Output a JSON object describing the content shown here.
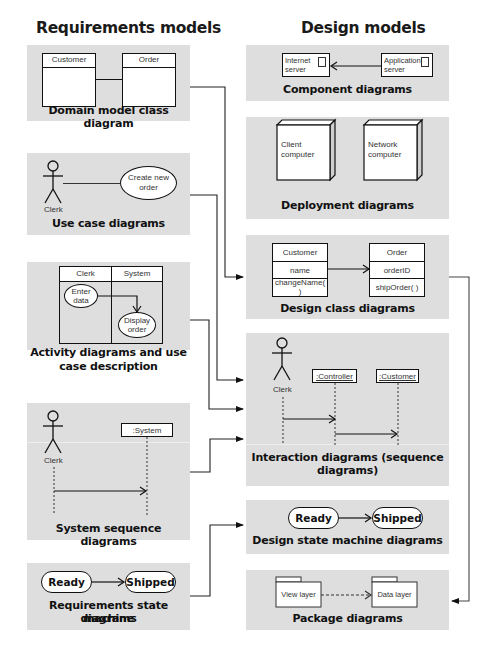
{
  "headings": {
    "left": "Requirements models",
    "right": "Design models"
  },
  "requirements": {
    "domain_model": {
      "caption": "Domain model class diagram",
      "classes": [
        "Customer",
        "Order"
      ]
    },
    "use_case": {
      "caption": "Use case diagrams",
      "actor": "Clerk",
      "use_case": "Create new order"
    },
    "activity": {
      "caption_line1": "Activity diagrams and use",
      "caption_line2": "case description",
      "swimlanes": [
        "Clerk",
        "System"
      ],
      "activities": [
        "Enter data",
        "Display order"
      ]
    },
    "system_sequence": {
      "caption": "System sequence diagrams",
      "actor": "Clerk",
      "object": ":System"
    },
    "state_machine": {
      "caption_line1": "Requirements state machine",
      "caption_line2": "diagrams",
      "states": [
        "Ready",
        "Shipped"
      ]
    }
  },
  "design": {
    "component": {
      "caption": "Component diagrams",
      "components": [
        "Internet server",
        "Application server"
      ]
    },
    "deployment": {
      "caption": "Deployment diagrams",
      "nodes": [
        "Client computer",
        "Network computer"
      ]
    },
    "design_class": {
      "caption": "Design class diagrams",
      "classes": [
        {
          "name": "Customer",
          "attribute": "name",
          "method": "changeName( )"
        },
        {
          "name": "Order",
          "attribute": "orderID",
          "method": "shipOrder( )"
        }
      ]
    },
    "interaction": {
      "caption_line1": "Interaction diagrams (sequence",
      "caption_line2": "diagrams)",
      "actor": "Clerk",
      "objects": [
        ":Controller",
        ":Customer"
      ]
    },
    "state_machine": {
      "caption": "Design state machine diagrams",
      "states": [
        "Ready",
        "Shipped"
      ]
    },
    "package": {
      "caption": "Package diagrams",
      "packages": [
        "View layer",
        "Data layer"
      ]
    }
  },
  "colors": {
    "panel_bg": "#dedede",
    "line": "#111111",
    "box_bg": "#ffffff"
  }
}
